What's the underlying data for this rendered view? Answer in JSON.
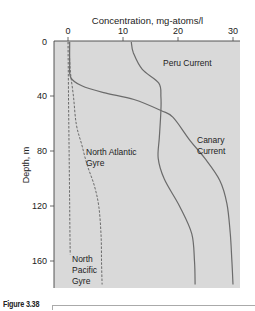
{
  "figure": {
    "caption": "Figure 3.38"
  },
  "chart_data": {
    "type": "line",
    "title": "Concentration, mg-atoms/l",
    "xlabel": "Concentration, mg-atoms/l",
    "ylabel": "Depth, m",
    "xlim": [
      -2.5,
      31
    ],
    "ylim": [
      180,
      0
    ],
    "x_axis_position": "top",
    "y_inverted": true,
    "xticks": [
      0,
      10,
      20,
      30
    ],
    "yticks": [
      0,
      40,
      80,
      120,
      160
    ],
    "grid": false,
    "background": "#d9d9d9",
    "series": [
      {
        "name": "Peru Current",
        "style": "solid",
        "color": "#6b6b6b",
        "points": [
          [
            11.5,
            0
          ],
          [
            11.9,
            8
          ],
          [
            13.5,
            20
          ],
          [
            16.5,
            30
          ],
          [
            16.9,
            40
          ],
          [
            16.9,
            50
          ],
          [
            16.6,
            70
          ],
          [
            16.4,
            85
          ],
          [
            17.5,
            100
          ],
          [
            20.3,
            120
          ],
          [
            22.5,
            140
          ],
          [
            23.0,
            160
          ],
          [
            23.1,
            177
          ]
        ]
      },
      {
        "name": "Canary Current",
        "style": "solid",
        "color": "#6b6b6b",
        "points": [
          [
            0.3,
            0
          ],
          [
            0.3,
            15
          ],
          [
            0.5,
            26
          ],
          [
            2.5,
            32
          ],
          [
            6.5,
            37
          ],
          [
            12,
            42
          ],
          [
            16.9,
            50
          ],
          [
            19.1,
            55
          ],
          [
            22.2,
            72
          ],
          [
            24.9,
            85
          ],
          [
            27.6,
            101
          ],
          [
            28.9,
            118
          ],
          [
            29.5,
            140
          ],
          [
            29.8,
            160
          ],
          [
            30.0,
            177
          ]
        ]
      },
      {
        "name": "North Atlantic Gyre",
        "style": "dashed",
        "color": "#6b6b6b",
        "points": [
          [
            0.2,
            0
          ],
          [
            0.4,
            20
          ],
          [
            1.0,
            40
          ],
          [
            1.5,
            60
          ],
          [
            2.5,
            75
          ],
          [
            3.5,
            90
          ],
          [
            4.8,
            105
          ],
          [
            5.6,
            120
          ],
          [
            6.0,
            140
          ],
          [
            6.1,
            160
          ],
          [
            6.2,
            177
          ]
        ]
      },
      {
        "name": "North Pacific Gyre",
        "style": "dashed",
        "color": "#6b6b6b",
        "points": [
          [
            0.0,
            0
          ],
          [
            0.1,
            40
          ],
          [
            0.2,
            80
          ],
          [
            0.3,
            120
          ],
          [
            0.4,
            155
          ]
        ]
      }
    ],
    "annotations": [
      {
        "text": "Peru Current",
        "x": 16.5,
        "y": 16
      },
      {
        "text": "Canary Current",
        "x": 24,
        "y": 78
      },
      {
        "text": "North Atlantic Gyre",
        "x": 3,
        "y": 82
      },
      {
        "text": "North Pacific Gyre",
        "x": 0,
        "y": 158
      }
    ]
  },
  "labels": {
    "xticks": [
      "0",
      "10",
      "20",
      "30"
    ],
    "yticks": [
      "0",
      "40",
      "80",
      "120",
      "160"
    ],
    "peru": "Peru Current",
    "canary_1": "Canary",
    "canary_2": "Current",
    "natl_1": "North Atlantic",
    "natl_2": "Gyre",
    "npac_1": "North",
    "npac_2": "Pacific",
    "npac_3": "Gyre"
  }
}
